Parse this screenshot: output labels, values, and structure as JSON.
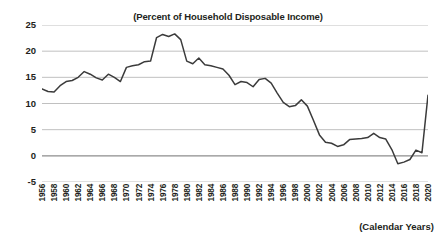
{
  "chart_data": {
    "type": "line",
    "title": "(Percent of Household Disposable Income)",
    "xlabel": "(Calendar Years)",
    "ylabel": "",
    "ylim": [
      -5,
      25
    ],
    "xlim": [
      1956,
      2020
    ],
    "ytick_step": 5,
    "yticks": [
      "25",
      "20",
      "15",
      "10",
      "5",
      "0",
      "-5"
    ],
    "ytick_values": [
      25,
      20,
      15,
      10,
      5,
      0,
      -5
    ],
    "xticks": [
      "1956",
      "1958",
      "1960",
      "1962",
      "1964",
      "1966",
      "1968",
      "1970",
      "1972",
      "1974",
      "1976",
      "1978",
      "1980",
      "1982",
      "1984",
      "1986",
      "1988",
      "1990",
      "1992",
      "1994",
      "1996",
      "1998",
      "2000",
      "2002",
      "2004",
      "2006",
      "2008",
      "2010",
      "2012",
      "2014",
      "2016",
      "2018",
      "2020"
    ],
    "xtick_values": [
      1956,
      1958,
      1960,
      1962,
      1964,
      1966,
      1968,
      1970,
      1972,
      1974,
      1976,
      1978,
      1980,
      1982,
      1984,
      1986,
      1988,
      1990,
      1992,
      1994,
      1996,
      1998,
      2000,
      2002,
      2004,
      2006,
      2008,
      2010,
      2012,
      2014,
      2016,
      2018,
      2020
    ],
    "grid": true,
    "grid_axis": "y",
    "legend": false,
    "line_color": "#3b3b3b",
    "grid_color": "#b9b9b9",
    "text_color": "#231f20",
    "background_color": "#ffffff",
    "series": [
      {
        "name": "Household saving rate",
        "x": [
          1956,
          1957,
          1958,
          1959,
          1960,
          1961,
          1962,
          1963,
          1964,
          1965,
          1966,
          1967,
          1968,
          1969,
          1970,
          1971,
          1972,
          1973,
          1974,
          1975,
          1976,
          1977,
          1978,
          1979,
          1980,
          1981,
          1982,
          1983,
          1984,
          1985,
          1986,
          1987,
          1988,
          1989,
          1990,
          1991,
          1992,
          1993,
          1994,
          1995,
          1996,
          1997,
          1998,
          1999,
          2000,
          2001,
          2002,
          2003,
          2004,
          2005,
          2006,
          2007,
          2008,
          2009,
          2010,
          2011,
          2012,
          2013,
          2014,
          2015,
          2016,
          2017,
          2018,
          2019,
          2020
        ],
        "values": [
          12.8,
          12.3,
          12.2,
          13.4,
          14.2,
          14.4,
          15.0,
          16.1,
          15.6,
          14.9,
          14.5,
          15.6,
          15.0,
          14.2,
          16.9,
          17.2,
          17.4,
          18.0,
          18.1,
          22.6,
          23.2,
          22.8,
          23.3,
          22.2,
          18.1,
          17.6,
          18.7,
          17.4,
          17.2,
          16.9,
          16.6,
          15.4,
          13.6,
          14.2,
          14.0,
          13.2,
          14.6,
          14.8,
          13.9,
          12.0,
          10.2,
          9.4,
          9.6,
          10.7,
          9.5,
          6.8,
          4.0,
          2.6,
          2.4,
          1.8,
          2.1,
          3.1,
          3.2,
          3.3,
          3.5,
          4.3,
          3.5,
          3.2,
          1.2,
          -1.5,
          -1.2,
          -0.7,
          1.1,
          0.6,
          11.6
        ]
      }
    ]
  }
}
